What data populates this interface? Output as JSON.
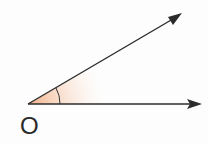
{
  "diagram": {
    "type": "angle",
    "vertex_label": "O",
    "colors": {
      "ray": "#2b2b2b",
      "fill": "#f2b48c",
      "arc": "#333333"
    }
  }
}
